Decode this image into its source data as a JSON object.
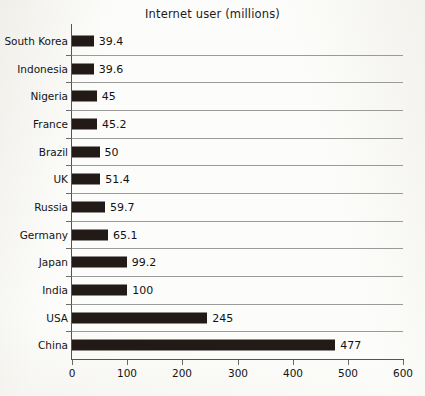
{
  "chart_data": {
    "type": "bar",
    "orientation": "horizontal",
    "title": "Internet user (millions)",
    "xlabel": "",
    "ylabel": "",
    "categories": [
      "South Korea",
      "Indonesia",
      "Nigeria",
      "France",
      "Brazil",
      "UK",
      "Russia",
      "Germany",
      "Japan",
      "India",
      "USA",
      "China"
    ],
    "values": [
      39.4,
      39.6,
      45,
      45.2,
      50,
      51.4,
      59.7,
      65.1,
      99.2,
      100,
      245,
      477
    ],
    "value_labels": [
      "39.4",
      "39.6",
      "45",
      "45.2",
      "50",
      "51.4",
      "59.7",
      "65.1",
      "99.2",
      "100",
      "245",
      "477"
    ],
    "xlim": [
      0,
      600
    ],
    "xticks": [
      0,
      100,
      200,
      300,
      400,
      500,
      600
    ],
    "xtick_labels": [
      "0",
      "100",
      "200",
      "300",
      "400",
      "500",
      "600"
    ],
    "grid": "horizontal",
    "legend": null,
    "bar_color": "#221a17",
    "grid_color": "#9a9a9a",
    "axis_color": "#545454",
    "background_color": "#fcfcfa"
  }
}
